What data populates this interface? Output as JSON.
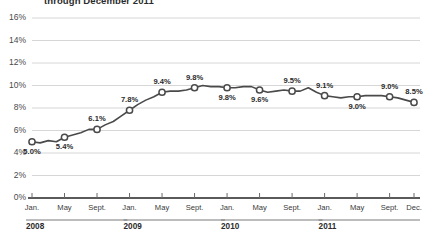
{
  "chart_data": {
    "type": "line",
    "title": "through December 2011",
    "xlabel": "",
    "ylabel": "",
    "ylim": [
      0,
      16
    ],
    "ytick_labels": [
      "0%",
      "2%",
      "4%",
      "6%",
      "8%",
      "10%",
      "12%",
      "14%",
      "16%"
    ],
    "ytick_values": [
      0,
      2,
      4,
      6,
      8,
      10,
      12,
      14,
      16
    ],
    "grid": true,
    "legend": "none",
    "x_tick_labels": [
      "Jan.",
      "May",
      "Sept.",
      "Jan.",
      "May",
      "Sept.",
      "Jan.",
      "May",
      "Sept.",
      "Jan.",
      "May",
      "Sept.",
      "Dec."
    ],
    "year_groups": [
      {
        "label": "2008",
        "start_index": 0,
        "end_index": 11
      },
      {
        "label": "2009",
        "start_index": 12,
        "end_index": 23
      },
      {
        "label": "2010",
        "start_index": 24,
        "end_index": 35
      },
      {
        "label": "2011",
        "start_index": 36,
        "end_index": 47
      }
    ],
    "x": [
      "Jan 2008",
      "Feb 2008",
      "Mar 2008",
      "Apr 2008",
      "May 2008",
      "Jun 2008",
      "Jul 2008",
      "Aug 2008",
      "Sep 2008",
      "Oct 2008",
      "Nov 2008",
      "Dec 2008",
      "Jan 2009",
      "Feb 2009",
      "Mar 2009",
      "Apr 2009",
      "May 2009",
      "Jun 2009",
      "Jul 2009",
      "Aug 2009",
      "Sep 2009",
      "Oct 2009",
      "Nov 2009",
      "Dec 2009",
      "Jan 2010",
      "Feb 2010",
      "Mar 2010",
      "Apr 2010",
      "May 2010",
      "Jun 2010",
      "Jul 2010",
      "Aug 2010",
      "Sep 2010",
      "Oct 2010",
      "Nov 2010",
      "Dec 2010",
      "Jan 2011",
      "Feb 2011",
      "Mar 2011",
      "Apr 2011",
      "May 2011",
      "Jun 2011",
      "Jul 2011",
      "Aug 2011",
      "Sep 2011",
      "Oct 2011",
      "Nov 2011",
      "Dec 2011"
    ],
    "values": [
      5.0,
      4.9,
      5.1,
      5.0,
      5.4,
      5.6,
      5.8,
      6.1,
      6.1,
      6.5,
      6.8,
      7.3,
      7.8,
      8.3,
      8.7,
      9.0,
      9.4,
      9.5,
      9.5,
      9.6,
      9.8,
      10.0,
      9.9,
      9.9,
      9.8,
      9.8,
      9.9,
      9.9,
      9.6,
      9.4,
      9.5,
      9.6,
      9.5,
      9.5,
      9.8,
      9.4,
      9.1,
      9.0,
      8.9,
      9.0,
      9.0,
      9.1,
      9.1,
      9.1,
      9.0,
      8.9,
      8.7,
      8.5
    ],
    "series": [
      {
        "name": "Unemployment rate",
        "values": [
          5.0,
          4.9,
          5.1,
          5.0,
          5.4,
          5.6,
          5.8,
          6.1,
          6.1,
          6.5,
          6.8,
          7.3,
          7.8,
          8.3,
          8.7,
          9.0,
          9.4,
          9.5,
          9.5,
          9.6,
          9.8,
          10.0,
          9.9,
          9.9,
          9.8,
          9.8,
          9.9,
          9.9,
          9.6,
          9.4,
          9.5,
          9.6,
          9.5,
          9.5,
          9.8,
          9.4,
          9.1,
          9.0,
          8.9,
          9.0,
          9.0,
          9.1,
          9.1,
          9.1,
          9.0,
          8.9,
          8.7,
          8.5
        ]
      }
    ],
    "labeled_points": [
      {
        "index": 0,
        "label": "5.0%",
        "value": 5.0,
        "label_pos": "below"
      },
      {
        "index": 4,
        "label": "5.4%",
        "value": 5.4,
        "label_pos": "below"
      },
      {
        "index": 8,
        "label": "6.1%",
        "value": 6.1,
        "label_pos": "above"
      },
      {
        "index": 12,
        "label": "7.8%",
        "value": 7.8,
        "label_pos": "above"
      },
      {
        "index": 16,
        "label": "9.4%",
        "value": 9.4,
        "label_pos": "above"
      },
      {
        "index": 20,
        "label": "9.8%",
        "value": 9.8,
        "label_pos": "above"
      },
      {
        "index": 24,
        "label": "9.8%",
        "value": 9.8,
        "label_pos": "below"
      },
      {
        "index": 28,
        "label": "9.6%",
        "value": 9.6,
        "label_pos": "below"
      },
      {
        "index": 32,
        "label": "9.5%",
        "value": 9.5,
        "label_pos": "above"
      },
      {
        "index": 36,
        "label": "9.1%",
        "value": 9.1,
        "label_pos": "above"
      },
      {
        "index": 40,
        "label": "9.0%",
        "value": 9.0,
        "label_pos": "below"
      },
      {
        "index": 44,
        "label": "9.0%",
        "value": 9.0,
        "label_pos": "above"
      },
      {
        "index": 47,
        "label": "8.5%",
        "value": 8.5,
        "label_pos": "above"
      }
    ],
    "colors": {
      "line": "#4a4a4a",
      "marker_fill": "#ffffff",
      "marker_stroke": "#4a4a4a",
      "grid": "#d6d6d6",
      "axis": "#6b6b6b",
      "text": "#2b2b2b"
    }
  }
}
